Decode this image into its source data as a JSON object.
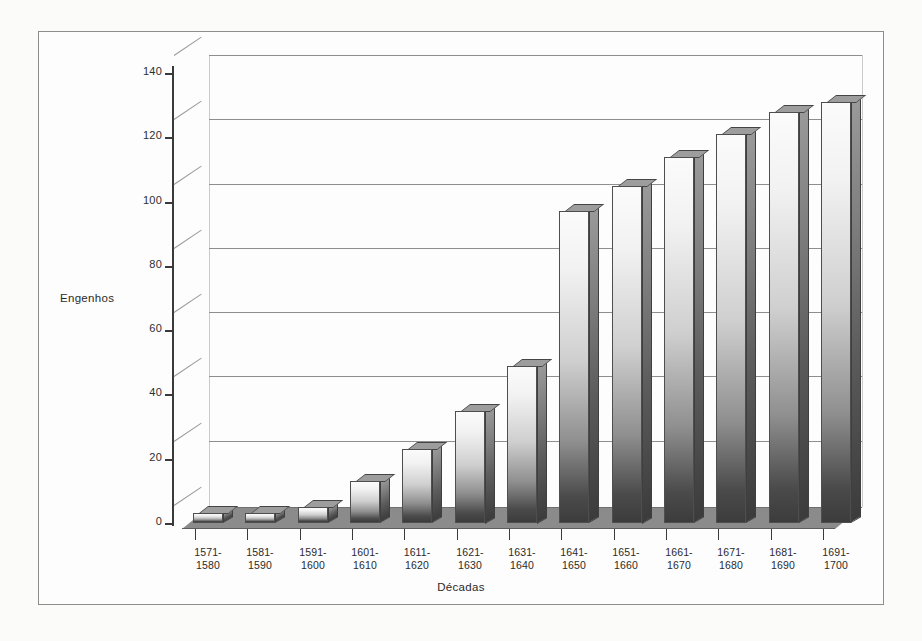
{
  "figure": {
    "y_axis_title": "Engenhos",
    "x_axis_title": "Décadas"
  },
  "chart_data": {
    "type": "bar",
    "title": "",
    "subtitle": "",
    "xlabel": "Décadas",
    "ylabel": "Engenhos",
    "ylim": [
      0,
      140
    ],
    "yticks": [
      0,
      20,
      40,
      60,
      80,
      100,
      120,
      140
    ],
    "grid": true,
    "legend": false,
    "legend_position": "none",
    "style": "3d-column",
    "categories": [
      "1571-1580",
      "1581-1590",
      "1591-1600",
      "1601-1610",
      "1611-1620",
      "1621-1630",
      "1631-1640",
      "1641-1650",
      "1651-1660",
      "1661-1670",
      "1671-1680",
      "1681-1690",
      "1691-1700"
    ],
    "category_lines": [
      [
        "1571-",
        "1580"
      ],
      [
        "1581-",
        "1590"
      ],
      [
        "1591-",
        "1600"
      ],
      [
        "1601-",
        "1610"
      ],
      [
        "1611-",
        "1620"
      ],
      [
        "1621-",
        "1630"
      ],
      [
        "1631-",
        "1640"
      ],
      [
        "1641-",
        "1650"
      ],
      [
        "1651-",
        "1660"
      ],
      [
        "1661-",
        "1670"
      ],
      [
        "1671-",
        "1680"
      ],
      [
        "1681-",
        "1690"
      ],
      [
        "1691-",
        "1700"
      ]
    ],
    "values": [
      3,
      3,
      5,
      13,
      23,
      35,
      49,
      97,
      105,
      114,
      121,
      128,
      131
    ],
    "colors": {
      "bar_top": "#fbfbfb",
      "bar_bottom": "#3c3c3c",
      "bar_side": "#5c5c5c",
      "floor": "#8b8b8b",
      "gridline": "#8e8e8e",
      "axis": "#3a3a3a",
      "text": "#2b2b2b",
      "frame": "#8d8d8d",
      "background": "#fdfdfd"
    }
  }
}
